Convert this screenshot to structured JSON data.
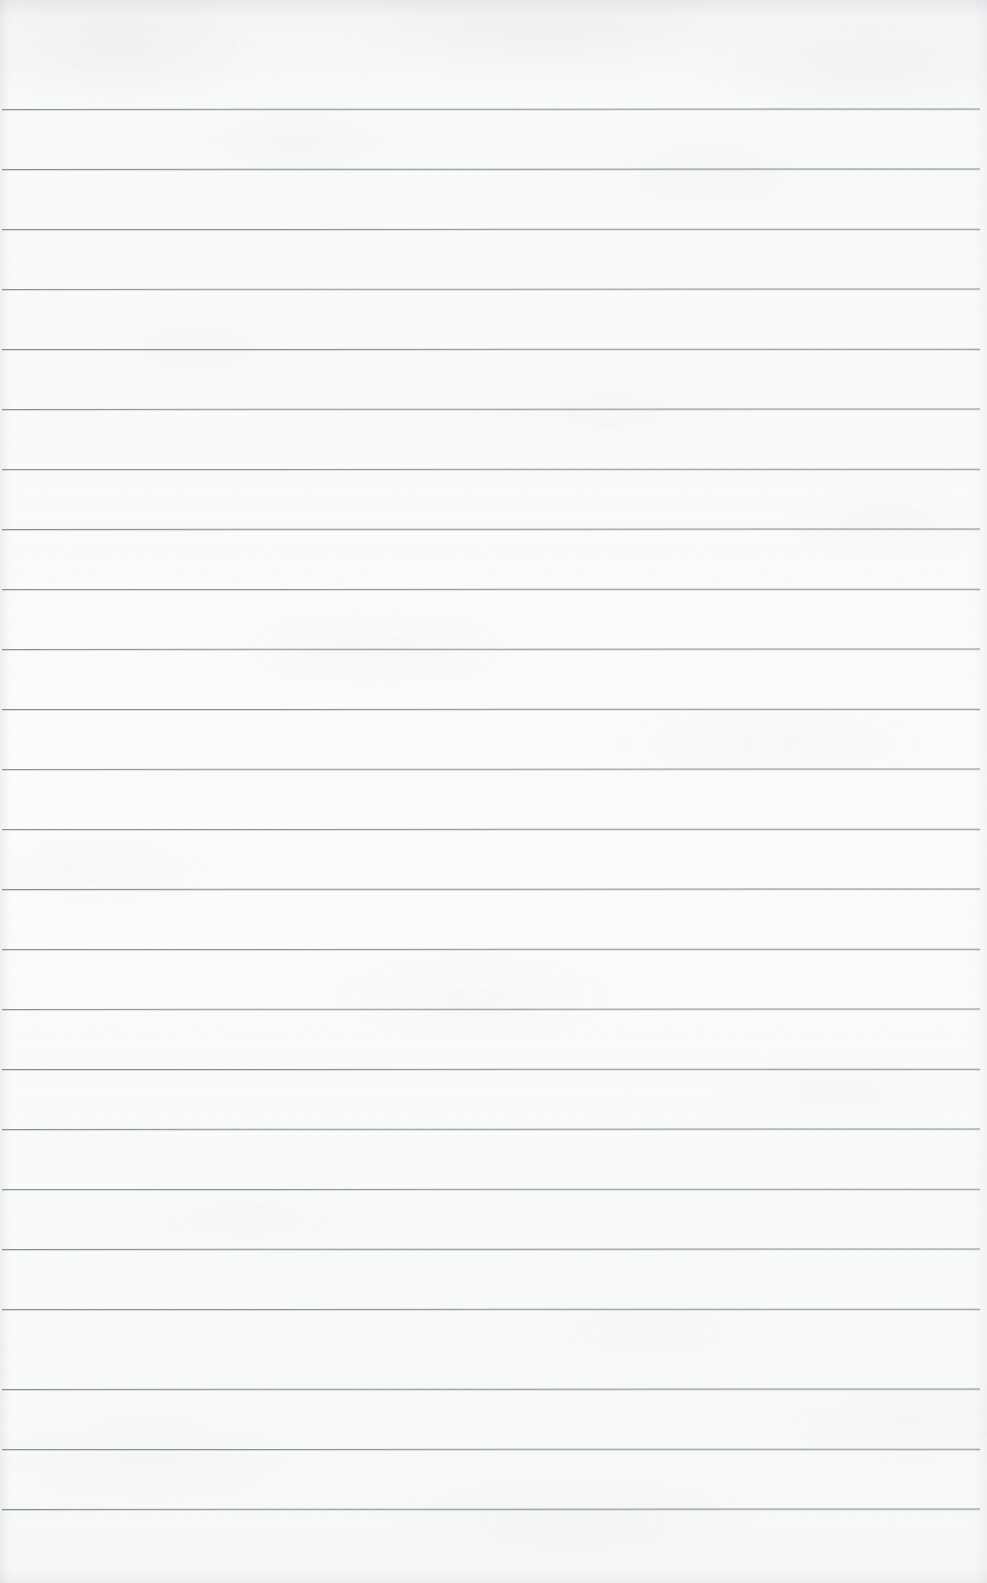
{
  "document": {
    "kind": "scanned-lined-notebook-paper",
    "title": "Blank lined paper",
    "width": 987,
    "height": 1583,
    "content_text": "",
    "has_handwriting": false,
    "orientation": "portrait"
  },
  "paper": {
    "background_color": "#fbfbfb",
    "top_tone_color": "#f4f5f6",
    "bottom_tone_color": "#f7f8f8",
    "texture": "mottled-scan-grain",
    "edge_shadow_color": "#bec2c6"
  },
  "ruling": {
    "line_color": "#82878c",
    "line_thickness_px": 1,
    "line_spacing_px": 60,
    "first_line_y": 109,
    "last_line_y": 1509,
    "line_count": 24,
    "line_start_x": 2,
    "line_end_x": 980,
    "top_margin_px": 109,
    "bottom_margin_px": 74,
    "has_vertical_margin_rule": false,
    "lines": [
      {
        "index": 1,
        "y": 109,
        "x1": 2,
        "x2": 980,
        "opacity": 0.92,
        "slope_deg": -0.03
      },
      {
        "index": 2,
        "y": 169,
        "x1": 2,
        "x2": 980,
        "opacity": 0.95,
        "slope_deg": -0.03
      },
      {
        "index": 3,
        "y": 229,
        "x1": 2,
        "x2": 980,
        "opacity": 0.93,
        "slope_deg": -0.02
      },
      {
        "index": 4,
        "y": 289,
        "x1": 2,
        "x2": 980,
        "opacity": 0.9,
        "slope_deg": -0.03
      },
      {
        "index": 5,
        "y": 349,
        "x1": 2,
        "x2": 980,
        "opacity": 0.94,
        "slope_deg": -0.02
      },
      {
        "index": 6,
        "y": 409,
        "x1": 2,
        "x2": 980,
        "opacity": 0.92,
        "slope_deg": -0.03
      },
      {
        "index": 7,
        "y": 469,
        "x1": 2,
        "x2": 980,
        "opacity": 0.91,
        "slope_deg": -0.02
      },
      {
        "index": 8,
        "y": 529,
        "x1": 2,
        "x2": 980,
        "opacity": 0.95,
        "slope_deg": -0.03
      },
      {
        "index": 9,
        "y": 589,
        "x1": 2,
        "x2": 980,
        "opacity": 0.93,
        "slope_deg": -0.02
      },
      {
        "index": 10,
        "y": 649,
        "x1": 2,
        "x2": 980,
        "opacity": 0.92,
        "slope_deg": -0.03
      },
      {
        "index": 11,
        "y": 709,
        "x1": 2,
        "x2": 980,
        "opacity": 0.94,
        "slope_deg": -0.02
      },
      {
        "index": 12,
        "y": 769,
        "x1": 2,
        "x2": 980,
        "opacity": 0.9,
        "slope_deg": -0.03
      },
      {
        "index": 13,
        "y": 829,
        "x1": 2,
        "x2": 980,
        "opacity": 0.93,
        "slope_deg": -0.02
      },
      {
        "index": 14,
        "y": 889,
        "x1": 2,
        "x2": 980,
        "opacity": 0.95,
        "slope_deg": -0.03
      },
      {
        "index": 15,
        "y": 949,
        "x1": 2,
        "x2": 980,
        "opacity": 0.92,
        "slope_deg": -0.02
      },
      {
        "index": 16,
        "y": 1009,
        "x1": 2,
        "x2": 980,
        "opacity": 0.91,
        "slope_deg": -0.03
      },
      {
        "index": 17,
        "y": 1069,
        "x1": 2,
        "x2": 980,
        "opacity": 0.94,
        "slope_deg": -0.02
      },
      {
        "index": 18,
        "y": 1129,
        "x1": 2,
        "x2": 980,
        "opacity": 0.93,
        "slope_deg": -0.03
      },
      {
        "index": 19,
        "y": 1189,
        "x1": 2,
        "x2": 980,
        "opacity": 0.9,
        "slope_deg": -0.02
      },
      {
        "index": 20,
        "y": 1249,
        "x1": 2,
        "x2": 980,
        "opacity": 0.94,
        "slope_deg": -0.03
      },
      {
        "index": 21,
        "y": 1309,
        "x1": 2,
        "x2": 980,
        "opacity": 0.92,
        "slope_deg": -0.02
      },
      {
        "index": 22,
        "y": 1389,
        "x1": 2,
        "x2": 980,
        "opacity": 0.93,
        "slope_deg": -0.03
      },
      {
        "index": 23,
        "y": 1449,
        "x1": 2,
        "x2": 980,
        "opacity": 0.91,
        "slope_deg": -0.02
      },
      {
        "index": 24,
        "y": 1509,
        "x1": 2,
        "x2": 980,
        "opacity": 0.94,
        "slope_deg": -0.03
      }
    ]
  }
}
